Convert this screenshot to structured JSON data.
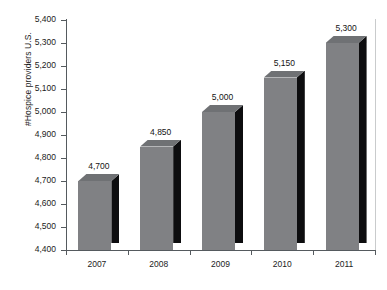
{
  "chart_data": {
    "type": "bar",
    "title": "",
    "subtitle": "",
    "xlabel": "",
    "ylabel": "#Hospice providers U.S.",
    "categories": [
      "2007",
      "2008",
      "2009",
      "2010",
      "2011"
    ],
    "values": [
      4700,
      4850,
      5000,
      5150,
      5300
    ],
    "data_labels": [
      "4,700",
      "4,850",
      "5,000",
      "5,150",
      "5,300"
    ],
    "series": [
      {
        "name": "#Hospice providers U.S.",
        "values": [
          4700,
          4850,
          5000,
          5150,
          5300
        ]
      }
    ],
    "ylim": [
      4400,
      5400
    ],
    "ytick_step": 100,
    "ytick_values": [
      5400,
      5300,
      5200,
      5100,
      5000,
      4900,
      4800,
      4700,
      4600,
      4500,
      4400
    ],
    "ytick_labels": [
      "5,400",
      "5,300",
      "5,200",
      "5,100",
      "5,000",
      "4,900",
      "4,800",
      "4,700",
      "4,600",
      "4,500",
      "4,400"
    ],
    "grid": false,
    "legend": false,
    "legend_position": "none",
    "style": "3d-column",
    "colors": {
      "bar_front": "#808184",
      "bar_top": "#6f7174",
      "bar_side": "#0d0d0f",
      "axis": "#555a5e",
      "plot_border": "#c9cbcc",
      "background": "#ffffff",
      "text": "#1c1c1c"
    }
  }
}
